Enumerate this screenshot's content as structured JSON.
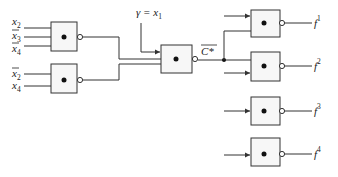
{
  "diagram": {
    "colors": {
      "line": "#333333",
      "gate_fill": "#f7f7f7",
      "text": "#222222"
    },
    "inputs_gate_a": [
      {
        "name": "x",
        "sub": "2",
        "bar": false
      },
      {
        "name": "x",
        "sub": "3",
        "bar": true
      },
      {
        "name": "x",
        "sub": "4",
        "bar": true
      }
    ],
    "inputs_gate_b": [
      {
        "name": "x",
        "sub": "2",
        "bar": true
      },
      {
        "name": "x",
        "sub": "4",
        "bar": false
      }
    ],
    "gamma_label": {
      "lhs": "γ = ",
      "name": "x",
      "sub": "1"
    },
    "intermediate_label": "C*",
    "outputs": [
      {
        "name": "f",
        "sup": "1"
      },
      {
        "name": "f",
        "sup": "2"
      },
      {
        "name": "f",
        "sup": "3"
      },
      {
        "name": "f",
        "sup": "4"
      }
    ]
  }
}
